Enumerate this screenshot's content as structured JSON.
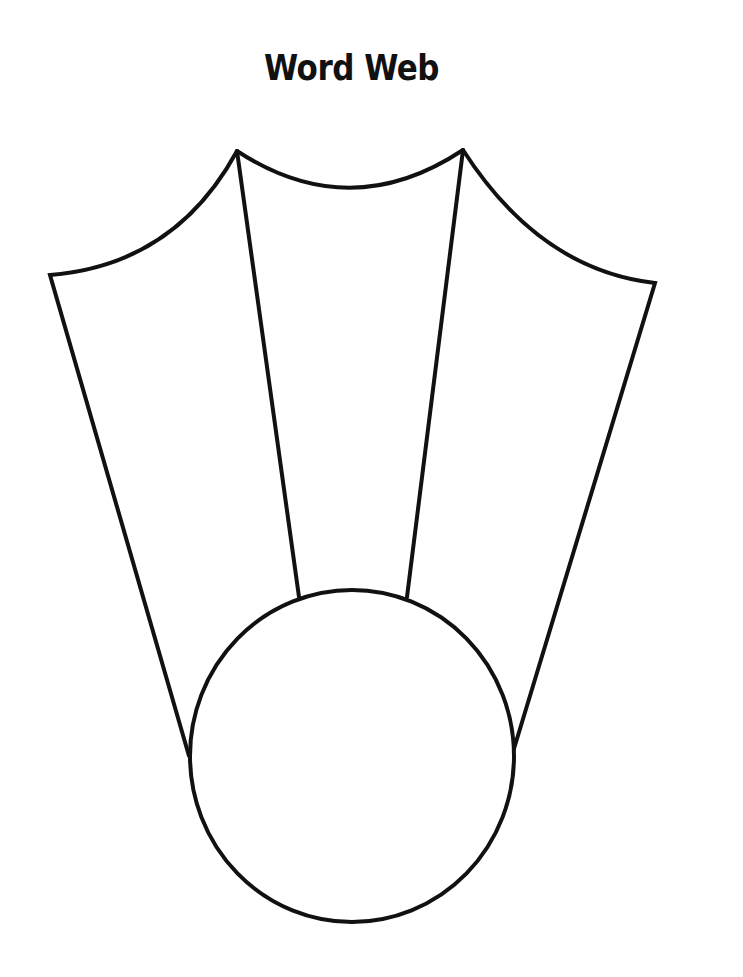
{
  "worksheet": {
    "title": "Word Web",
    "diagram": {
      "type": "word-web",
      "center": {
        "label": "",
        "shape": "circle"
      },
      "spokes": [
        {
          "position": "left",
          "label": ""
        },
        {
          "position": "center",
          "label": ""
        },
        {
          "position": "right",
          "label": ""
        }
      ]
    },
    "colors": {
      "line": "#111111",
      "background": "#ffffff"
    }
  }
}
